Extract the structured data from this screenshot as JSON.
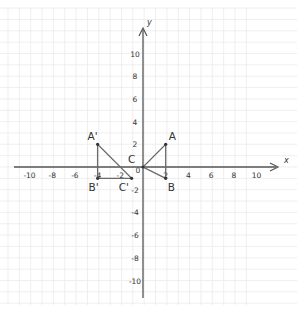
{
  "diagram": {
    "type": "coordinate-plane",
    "axes": {
      "x_label": "x",
      "y_label": "y",
      "x_ticks": [
        {
          "value": -10,
          "label": "-10"
        },
        {
          "value": -8,
          "label": "-8"
        },
        {
          "value": -6,
          "label": "-6"
        },
        {
          "value": -4,
          "label": "-4"
        },
        {
          "value": -2,
          "label": "-2"
        },
        {
          "value": 0,
          "label": "0"
        },
        {
          "value": 2,
          "label": "2"
        },
        {
          "value": 4,
          "label": "4"
        },
        {
          "value": 6,
          "label": "6"
        },
        {
          "value": 8,
          "label": "8"
        },
        {
          "value": 10,
          "label": "10"
        }
      ],
      "y_ticks": [
        {
          "value": 10,
          "label": "10"
        },
        {
          "value": 8,
          "label": "8"
        },
        {
          "value": 6,
          "label": "6"
        },
        {
          "value": 4,
          "label": "4"
        },
        {
          "value": 2,
          "label": "2"
        },
        {
          "value": -2,
          "label": "-2"
        },
        {
          "value": -4,
          "label": "-4"
        },
        {
          "value": -6,
          "label": "-6"
        },
        {
          "value": -8,
          "label": "-8"
        },
        {
          "value": -10,
          "label": "-10"
        }
      ]
    },
    "triangles": [
      {
        "name": "ABC",
        "points": [
          {
            "label": "A",
            "x": 2,
            "y": 2
          },
          {
            "label": "B",
            "x": 2,
            "y": -1
          },
          {
            "label": "C",
            "x": 0,
            "y": 0
          }
        ]
      },
      {
        "name": "A'B'C'",
        "points": [
          {
            "label": "A'",
            "x": -4,
            "y": 2
          },
          {
            "label": "B'",
            "x": -4,
            "y": -1
          },
          {
            "label": "C'",
            "x": -1,
            "y": -1
          }
        ]
      }
    ],
    "colors": {
      "axis": "#555555",
      "grid": "#ebebeb",
      "shape": "#6a6a6a",
      "point": "#333333"
    }
  }
}
